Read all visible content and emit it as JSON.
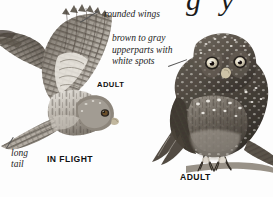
{
  "plate": {
    "background_color": "#fdfdfd",
    "title_cut_fragment": "g y",
    "annotations": [
      {
        "id": "rounded-wings",
        "text": "rounded wings",
        "style": "italic",
        "target": "wing-tip-of-flying-owl"
      },
      {
        "id": "upperparts",
        "text": "brown to gray upperparts with white spots",
        "style": "italic",
        "target": "back-of-perched-owl"
      },
      {
        "id": "long-tail",
        "text": "long tail",
        "style": "italic",
        "target": "tail-of-flying-owl"
      }
    ],
    "annotation_lines": {
      "rounded_wings": "rounded wings",
      "upperparts_l1": "brown to gray",
      "upperparts_l2": "upperparts with",
      "upperparts_l3": "white spots",
      "long_tail_l1": "long",
      "long_tail_l2": "tail"
    },
    "figure_labels": [
      {
        "id": "adult-flight",
        "text": "ADULT",
        "style": "bold-caps"
      },
      {
        "id": "in-flight",
        "text": "IN FLIGHT",
        "style": "bold-caps"
      },
      {
        "id": "adult-perched",
        "text": "ADULT",
        "style": "bold-caps"
      }
    ],
    "figures": [
      {
        "id": "flying-owl",
        "pose": "in flight, ventral view, wings spread",
        "plumage": "barred wings, streaked underparts, long barred tail"
      },
      {
        "id": "perched-owl",
        "pose": "perched frontal, facing viewer",
        "plumage": "brown to gray upperparts with white spots, pale yellow eyes, streaked breast, talons on branch"
      }
    ],
    "colors": {
      "ink": "#1c1c1c",
      "leader_line": "#555555",
      "plumage_dark": "#4a443e",
      "plumage_mid": "#7d766d",
      "plumage_light": "#c9c4bc",
      "highlight": "#ffffff"
    }
  }
}
